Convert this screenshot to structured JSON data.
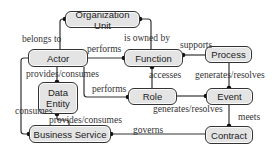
{
  "diagram": {
    "nodes": {
      "organization_unit": "Organization Unit",
      "actor": "Actor",
      "function": "Function",
      "process": "Process",
      "data_entity": "Data Entity",
      "role": "Role",
      "event": "Event",
      "business_service": "Business Service",
      "contract": "Contract"
    },
    "edges": {
      "belongs_to": "belongs to",
      "is_owned_by": "is owned by",
      "performs_actor_function": "performs",
      "supports": "supports",
      "provides_consumes_actor_data": "provides/consumes",
      "performs_actor_role": "performs",
      "accesses": "accesses",
      "generates_resolves_process_event": "generates/resolves",
      "consumes": "consumes",
      "generates_resolves_role_event": "generates/resolves",
      "meets": "meets",
      "provides_consumes_data_service": "provides/consumes",
      "governs": "governs"
    },
    "colors": {
      "node_fill": "#e4e4e4",
      "node_border": "#333333",
      "edge": "#333333"
    }
  }
}
